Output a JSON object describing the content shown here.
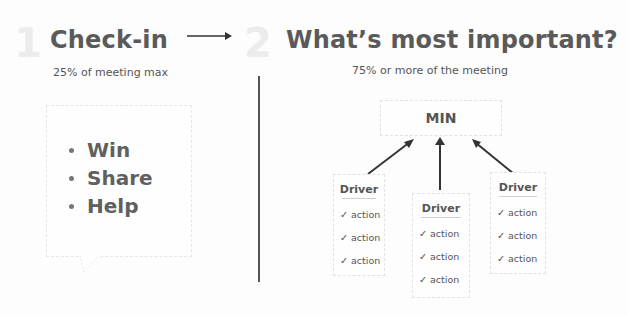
{
  "left": {
    "step_number": "1",
    "title": "Check-in",
    "subtitle": "25% of meeting max",
    "bullets": [
      "Win",
      "Share",
      "Help"
    ]
  },
  "right": {
    "step_number": "2",
    "title": "What’s most important?",
    "subtitle": "75% or more of the meeting",
    "top_box_label": "MIN",
    "drivers": [
      {
        "title": "Driver",
        "actions": [
          "action",
          "action",
          "action"
        ]
      },
      {
        "title": "Driver",
        "actions": [
          "action",
          "action",
          "action"
        ]
      },
      {
        "title": "Driver",
        "actions": [
          "action",
          "action",
          "action"
        ]
      }
    ]
  },
  "icons": {
    "check": "✓",
    "arrow": "right-arrow"
  }
}
